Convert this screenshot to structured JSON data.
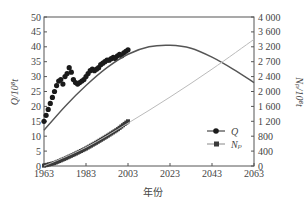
{
  "chart_data": {
    "type": "line",
    "title": "",
    "xlabel": "年份",
    "ylabel_left": "Q/10⁸t",
    "ylabel_right": "Nₚ/10⁸t",
    "x_ticks": [
      "1963",
      "1983",
      "2003",
      "2023",
      "2043",
      "2063"
    ],
    "xlim": [
      1963,
      2063
    ],
    "ylim_left": [
      0,
      50
    ],
    "y_ticks_left": [
      "0",
      "5",
      "10",
      "15",
      "20",
      "25",
      "30",
      "35",
      "40",
      "45",
      "50"
    ],
    "ylim_right": [
      0,
      4000
    ],
    "y_ticks_right": [
      "0",
      "400",
      "800",
      "1 200",
      "1 600",
      "2 000",
      "2 400",
      "2 700",
      "3 200",
      "3 600",
      "4 000"
    ],
    "legend": [
      {
        "label": "Q",
        "marker": "circle",
        "color": "#1a1a1a"
      },
      {
        "label": "Nₚ",
        "marker": "square",
        "color": "#555555"
      }
    ],
    "legend_position": "lower-right",
    "grid": false,
    "series": [
      {
        "name": "Q (observed)",
        "axis": "left",
        "style": "markers-circle",
        "x": [
          1963,
          1964,
          1965,
          1966,
          1967,
          1968,
          1969,
          1970,
          1971,
          1972,
          1973,
          1974,
          1975,
          1976,
          1977,
          1978,
          1979,
          1980,
          1981,
          1982,
          1983,
          1984,
          1985,
          1986,
          1987,
          1988,
          1989,
          1990,
          1991,
          1992,
          1993,
          1994,
          1995,
          1996,
          1997,
          1998,
          1999,
          2000,
          2001,
          2002,
          2003
        ],
        "values": [
          15,
          17,
          19,
          21,
          23,
          25,
          27,
          28.5,
          29,
          27.5,
          30,
          31,
          33,
          31.5,
          29,
          28,
          27.5,
          28,
          28.5,
          29,
          30,
          31,
          32,
          32.5,
          32,
          32.5,
          33,
          34,
          34.5,
          35,
          35.5,
          35.5,
          36,
          36.5,
          36,
          37,
          37.5,
          37,
          38,
          38.5,
          39
        ]
      },
      {
        "name": "Q (model)",
        "axis": "left",
        "style": "line",
        "x": [
          1963,
          1973,
          1983,
          1993,
          2003,
          2013,
          2023,
          2033,
          2043,
          2053,
          2063
        ],
        "values": [
          12,
          20,
          27,
          33,
          37.5,
          40,
          40.5,
          39.5,
          36.5,
          32.5,
          28
        ]
      },
      {
        "name": "Np (observed)",
        "axis": "right",
        "style": "markers-square",
        "x": [
          1963,
          1968,
          1973,
          1978,
          1983,
          1988,
          1993,
          1998,
          2003
        ],
        "values": [
          10,
          80,
          200,
          330,
          470,
          630,
          800,
          980,
          1200
        ]
      },
      {
        "name": "Np (model)",
        "axis": "right",
        "style": "line-light",
        "x": [
          1963,
          1983,
          2003,
          2023,
          2043,
          2063
        ],
        "values": [
          0,
          500,
          1150,
          1850,
          2600,
          3400
        ]
      }
    ]
  }
}
